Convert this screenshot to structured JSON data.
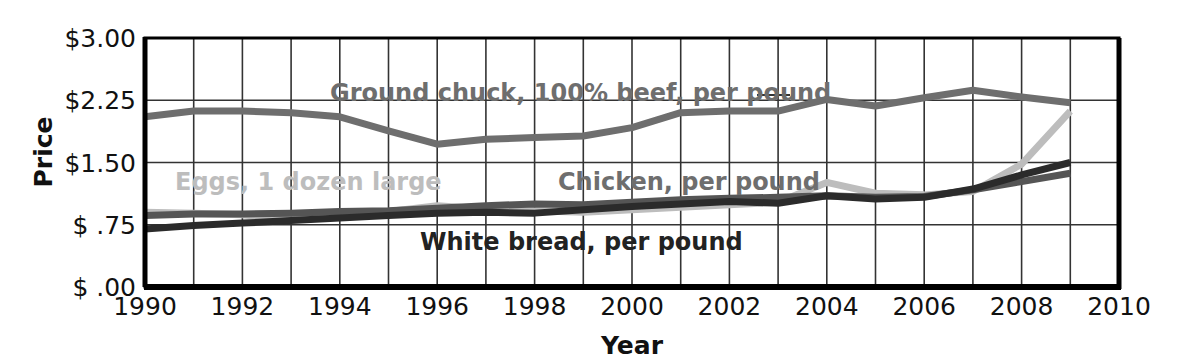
{
  "chart_data": {
    "type": "line",
    "title": "",
    "xlabel": "Year",
    "ylabel": "Price",
    "xlim": [
      1990,
      2010
    ],
    "ylim": [
      0,
      3.0
    ],
    "grid": true,
    "legend_position": "inline-annotations",
    "x_tick_labels": [
      "1990",
      "1992",
      "1994",
      "1996",
      "1998",
      "2000",
      "2002",
      "2004",
      "2006",
      "2008",
      "2010"
    ],
    "x_ticks": [
      1990,
      1992,
      1994,
      1996,
      1998,
      2000,
      2002,
      2004,
      2006,
      2008,
      2010
    ],
    "y_tick_labels": [
      "$3.00",
      "$2.25",
      "$1.50",
      "$ .75",
      "$ .00"
    ],
    "y_ticks": [
      3.0,
      2.25,
      1.5,
      0.75,
      0.0
    ],
    "x": [
      1990,
      1991,
      1992,
      1993,
      1994,
      1995,
      1996,
      1997,
      1998,
      1999,
      2000,
      2001,
      2002,
      2003,
      2004,
      2005,
      2006,
      2007,
      2008,
      2009
    ],
    "series": [
      {
        "name": "Ground chuck, 100% beef, per pound",
        "color": "#6e6e6e",
        "label_text": "Ground chuck, 100% beef, per pound",
        "values": [
          2.05,
          2.12,
          2.12,
          2.1,
          2.05,
          1.88,
          1.72,
          1.78,
          1.8,
          1.82,
          1.92,
          2.1,
          2.12,
          2.12,
          2.26,
          2.18,
          2.28,
          2.37,
          2.29,
          2.22
        ]
      },
      {
        "name": "Eggs, 1 dozen large",
        "color": "#bdbdbd",
        "label_text": "Eggs, 1 dozen large",
        "values": [
          0.9,
          0.89,
          0.87,
          0.81,
          0.85,
          0.91,
          0.98,
          0.94,
          0.92,
          0.9,
          0.93,
          0.96,
          0.99,
          1.02,
          1.26,
          1.13,
          1.11,
          1.15,
          1.48,
          2.12
        ]
      },
      {
        "name": "Chicken, per pound",
        "color": "#555555",
        "label_text": "Chicken, per pound",
        "values": [
          0.86,
          0.88,
          0.88,
          0.89,
          0.91,
          0.92,
          0.95,
          0.98,
          1.0,
          0.99,
          1.02,
          1.05,
          1.07,
          1.08,
          1.1,
          1.08,
          1.09,
          1.17,
          1.27,
          1.37
        ]
      },
      {
        "name": "White bread, per pound",
        "color": "#2b2b2b",
        "label_text": "White bread, per pound",
        "values": [
          0.7,
          0.74,
          0.77,
          0.8,
          0.83,
          0.86,
          0.89,
          0.9,
          0.89,
          0.93,
          0.97,
          1.0,
          1.03,
          1.01,
          1.1,
          1.06,
          1.08,
          1.18,
          1.35,
          1.5
        ]
      }
    ],
    "annotations": [
      {
        "name": "ground-chuck",
        "text": "Ground chuck, 100% beef, per pound",
        "x": 330,
        "y": 101,
        "color": "#6e6e6e",
        "anchor": "start",
        "leader": {
          "x1": 757,
          "y1": 95,
          "x2": 790,
          "y2": 95
        }
      },
      {
        "name": "eggs",
        "text": "Eggs, 1 dozen large",
        "x": 175,
        "y": 190,
        "color": "#bdbdbd",
        "anchor": "start",
        "leader": null
      },
      {
        "name": "chicken",
        "text": "Chicken, per pound",
        "x": 558,
        "y": 190,
        "color": "#6e6e6e",
        "anchor": "start",
        "leader": null
      },
      {
        "name": "white-bread",
        "text": "White bread, per pound",
        "x": 420,
        "y": 250,
        "color": "#222222",
        "anchor": "start",
        "leader": null
      }
    ]
  },
  "axes": {
    "y_title": "Price",
    "x_title": "Year"
  },
  "colors": {
    "background": "#ffffff",
    "grid": "#333333",
    "frame": "#000000",
    "text": "#111111"
  }
}
